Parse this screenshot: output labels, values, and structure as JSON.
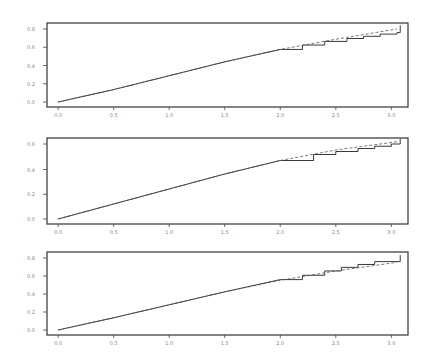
{
  "chart_data": [
    {
      "type": "line",
      "title": "",
      "xlabel": "",
      "ylabel": "",
      "xlim": [
        -0.1,
        3.15
      ],
      "ylim": [
        0,
        1
      ],
      "x_ticks": [
        "0.0",
        "0.5",
        "1.0",
        "1.5",
        "2.0",
        "2.5",
        "3.0"
      ],
      "x_tick_values": [
        0.0,
        0.5,
        1.0,
        1.5,
        2.0,
        2.5,
        3.0
      ],
      "y_ticks": [
        "0.0",
        "0.2",
        "0.4",
        "0.6",
        "0.8"
      ],
      "y_tick_values": [
        0.0,
        0.25,
        0.5,
        0.75,
        1.0
      ],
      "series": [
        {
          "name": "empirical step",
          "style": "solid-step",
          "x": [
            0.0,
            0.5,
            1.0,
            1.5,
            2.0,
            2.2,
            2.4,
            2.6,
            2.75,
            2.9,
            3.05,
            3.08
          ],
          "y": [
            0.0,
            0.17,
            0.36,
            0.55,
            0.72,
            0.78,
            0.83,
            0.87,
            0.9,
            0.93,
            0.95,
            1.05
          ]
        },
        {
          "name": "fitted",
          "style": "dashed",
          "x": [
            0.0,
            0.5,
            1.0,
            1.5,
            2.0,
            2.5,
            3.05
          ],
          "y": [
            0.0,
            0.17,
            0.36,
            0.55,
            0.72,
            0.86,
            1.0
          ]
        }
      ]
    },
    {
      "type": "line",
      "title": "",
      "xlabel": "",
      "ylabel": "",
      "xlim": [
        -0.1,
        3.15
      ],
      "ylim": [
        0,
        1
      ],
      "x_ticks": [
        "0.0",
        "0.5",
        "1.0",
        "1.5",
        "2.0",
        "2.5",
        "3.0"
      ],
      "x_tick_values": [
        0.0,
        0.5,
        1.0,
        1.5,
        2.0,
        2.5,
        3.0
      ],
      "y_ticks": [
        "0.0",
        "0.2",
        "0.4",
        "0.6"
      ],
      "y_tick_values": [
        0.0,
        0.33,
        0.66,
        1.0
      ],
      "series": [
        {
          "name": "empirical step",
          "style": "solid-step",
          "x": [
            0.0,
            0.5,
            1.0,
            1.5,
            2.0,
            2.3,
            2.5,
            2.7,
            2.85,
            3.0,
            3.08
          ],
          "y": [
            0.0,
            0.2,
            0.4,
            0.6,
            0.78,
            0.86,
            0.9,
            0.94,
            0.97,
            1.0,
            1.07
          ]
        },
        {
          "name": "fitted",
          "style": "dashed",
          "x": [
            0.0,
            0.5,
            1.0,
            1.5,
            2.0,
            2.5,
            3.05
          ],
          "y": [
            0.0,
            0.2,
            0.4,
            0.6,
            0.78,
            0.92,
            1.03
          ]
        }
      ]
    },
    {
      "type": "line",
      "title": "",
      "xlabel": "",
      "ylabel": "",
      "xlim": [
        -0.1,
        3.15
      ],
      "ylim": [
        0,
        1
      ],
      "x_ticks": [
        "0.0",
        "0.5",
        "1.0",
        "1.5",
        "2.0",
        "2.5",
        "3.0"
      ],
      "x_tick_values": [
        0.0,
        0.5,
        1.0,
        1.5,
        2.0,
        2.5,
        3.0
      ],
      "y_ticks": [
        "0.0",
        "0.2",
        "0.4",
        "0.6",
        "0.8"
      ],
      "y_tick_values": [
        0.0,
        0.25,
        0.5,
        0.75,
        1.0
      ],
      "series": [
        {
          "name": "empirical step",
          "style": "solid-step",
          "x": [
            0.0,
            0.5,
            1.0,
            1.5,
            2.0,
            2.2,
            2.4,
            2.55,
            2.7,
            2.85,
            3.08
          ],
          "y": [
            0.0,
            0.17,
            0.35,
            0.53,
            0.7,
            0.76,
            0.82,
            0.87,
            0.91,
            0.95,
            1.04
          ]
        },
        {
          "name": "fitted",
          "style": "dashed",
          "x": [
            0.0,
            0.5,
            1.0,
            1.5,
            2.0,
            2.5,
            3.05
          ],
          "y": [
            0.0,
            0.17,
            0.35,
            0.53,
            0.69,
            0.82,
            0.94
          ]
        }
      ]
    }
  ]
}
